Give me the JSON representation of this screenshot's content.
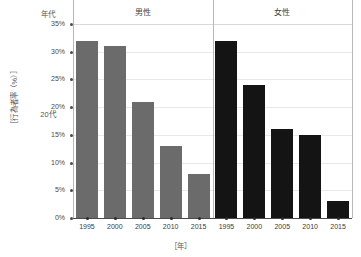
{
  "labels": {
    "era_header": "年代",
    "row_label": "20代",
    "y_axis_title": "［行為者率（%）］",
    "x_axis_title": "［年］"
  },
  "groups": [
    {
      "name": "male",
      "label": "男性",
      "color": "#6b6b6b"
    },
    {
      "name": "female",
      "label": "女性",
      "color": "#141414"
    }
  ],
  "y_ticks": [
    "0%",
    "5%",
    "10%",
    "15%",
    "20%",
    "25%",
    "30%",
    "35%"
  ],
  "x_ticks_male": [
    "1995",
    "2000",
    "2005",
    "2010",
    "2015"
  ],
  "x_ticks_female": [
    "1995",
    "2000",
    "2005",
    "2010",
    "2015"
  ],
  "chart_data": {
    "type": "bar",
    "title": "",
    "subtitle": "",
    "xlabel": "［年］",
    "ylabel": "［行為者率（%）］",
    "categories": [
      "1995",
      "2000",
      "2005",
      "2010",
      "2015"
    ],
    "ylim": [
      0,
      35
    ],
    "ytick_values": [
      0,
      5,
      10,
      15,
      20,
      25,
      30,
      35
    ],
    "ytick_labels": [
      "0%",
      "5%",
      "10%",
      "15%",
      "20%",
      "25%",
      "30%",
      "35%"
    ],
    "grid": true,
    "legend_position": "top-panel-headers",
    "panels": [
      {
        "panel_label": "男性",
        "color": "#6b6b6b"
      },
      {
        "panel_label": "女性",
        "color": "#141414"
      }
    ],
    "series": [
      {
        "name": "男性",
        "color": "#6b6b6b",
        "values": [
          32,
          31,
          21,
          13,
          8
        ]
      },
      {
        "name": "女性",
        "color": "#141414",
        "values": [
          32,
          24,
          16,
          15,
          3
        ]
      }
    ],
    "row_category": "20代",
    "row_category_header": "年代"
  }
}
